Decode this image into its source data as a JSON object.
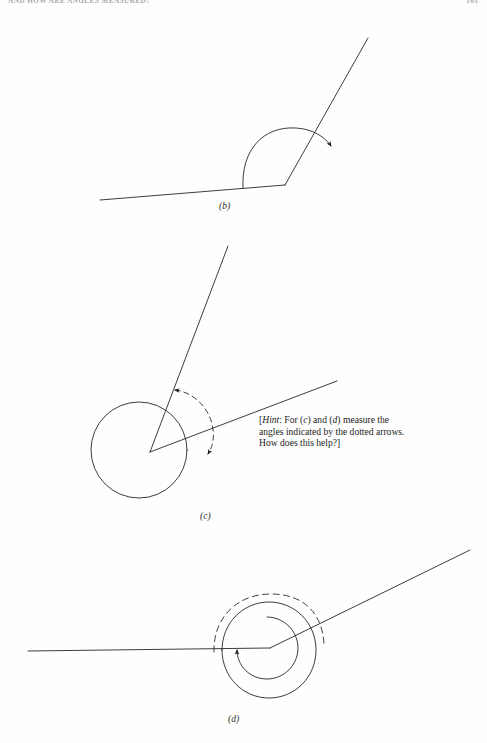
{
  "page": {
    "running_head": "AND HOW ARE ANGLES MEASURED?",
    "folio": "163",
    "background_color": "#fefefe",
    "ink_color": "#1a1a1a",
    "width": 487,
    "height": 743
  },
  "figures": [
    {
      "id": "b",
      "caption": "(b)",
      "kind": "angle-diagram",
      "description": "Obtuse angle formed by a near-horizontal base line and an upward ray, with a solid curved arrow sweeping counterclockwise from the base line to the ray.",
      "vertex": [
        285,
        185
      ],
      "base_line": [
        [
          100,
          200
        ],
        [
          285,
          185
        ]
      ],
      "ray": [
        [
          285,
          185
        ],
        [
          368,
          38
        ]
      ],
      "arc": {
        "style": "solid",
        "arrowheads": [
          "end"
        ],
        "radius": 55
      }
    },
    {
      "id": "c",
      "caption": "(c)",
      "kind": "angle-diagram",
      "description": "Two rays from a common vertex surrounded by a full solid circle; a dashed arc with arrowheads on both ends marks the angle between the rays.",
      "vertex": [
        150,
        452
      ],
      "ray_1": [
        [
          150,
          452
        ],
        [
          228,
          246
        ]
      ],
      "ray_2": [
        [
          150,
          452
        ],
        [
          337,
          381
        ]
      ],
      "circle": {
        "center": [
          139,
          450
        ],
        "radius": 48,
        "style": "solid"
      },
      "arc": {
        "style": "dashed",
        "arrowheads": [
          "start",
          "end"
        ],
        "radius": 72
      }
    },
    {
      "id": "d",
      "caption": "(d)",
      "kind": "angle-diagram",
      "description": "A horizontal base line meeting an upward ray at a vertex; a solid inner circle with an arrowhead wraps the vertex, an outer solid circle surrounds it, and a dashed arc arches above.",
      "vertex": [
        270,
        648
      ],
      "base_line": [
        [
          28,
          651
        ],
        [
          270,
          648
        ]
      ],
      "ray": [
        [
          270,
          648
        ],
        [
          470,
          550
        ]
      ],
      "inner_circle": {
        "center": [
          268,
          648
        ],
        "radius": 31,
        "style": "solid",
        "arrowheads": [
          "end"
        ]
      },
      "outer_circle": {
        "center": [
          268,
          650
        ],
        "radius": 48,
        "style": "solid"
      },
      "dashed_arc": {
        "center": [
          268,
          648
        ],
        "radius": 54,
        "style": "dashed"
      }
    }
  ],
  "hint": {
    "open_bracket": "[",
    "label": "Hint",
    "colon": ": For (",
    "ref_1": "c",
    "conjunction": ") and (",
    "ref_2": "d",
    "text_1": ") measure the angles indicated by the dotted arrows. How does this help?",
    "close_bracket": "]",
    "full_text": "[Hint: For (c) and (d) measure the angles indicated by the dotted arrows. How does this help?]"
  }
}
